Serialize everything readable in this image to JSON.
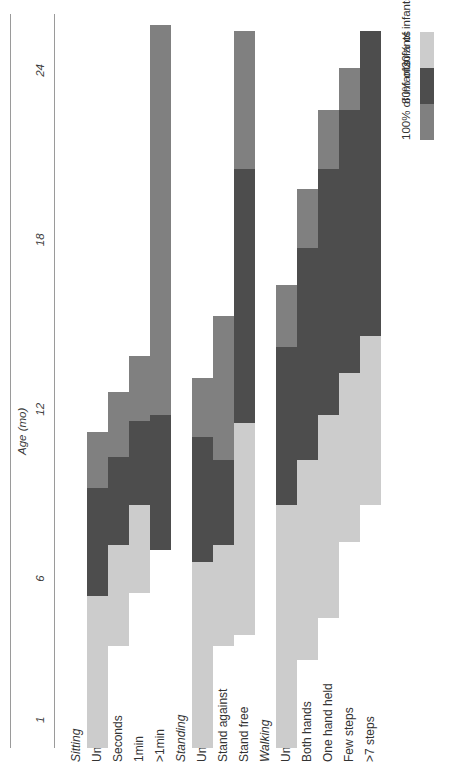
{
  "chart_data": {
    "type": "bar",
    "title": "",
    "xlabel": "Age (mo)",
    "ylabel": "",
    "xlim": [
      0,
      26
    ],
    "xticks": [
      1,
      6,
      12,
      18,
      24
    ],
    "xtick_labels": [
      "1",
      "6",
      "12",
      "18",
      "24"
    ],
    "grid": false,
    "legend_position": "bottom-right",
    "orientation": "horizontal",
    "note": "Horizontal range bars: each milestone row spans the age interval during which the stated proportion of infants show the skill.",
    "colors": {
      "pct100": "#808080",
      "pct80": "#4d4d4d",
      "pct20": "#cccccc",
      "axis": "#9a9a9a",
      "text": "#333333"
    },
    "groups": [
      {
        "name": "Sitting",
        "rows": [
          {
            "label": "Unable",
            "segments": [
              {
                "level": "20% of infants",
                "color": "#cccccc",
                "start": 0.0,
                "end": 5.4
              },
              {
                "level": "80% of infants",
                "color": "#4d4d4d",
                "start": 5.4,
                "end": 9.2
              },
              {
                "level": "100% of infants",
                "color": "#808080",
                "start": 9.2,
                "end": 11.2
              }
            ]
          },
          {
            "label": "Seconds",
            "segments": [
              {
                "level": "20% of infants",
                "color": "#cccccc",
                "start": 3.6,
                "end": 7.2
              },
              {
                "level": "80% of infants",
                "color": "#4d4d4d",
                "start": 7.2,
                "end": 10.3
              },
              {
                "level": "100% of infants",
                "color": "#808080",
                "start": 10.3,
                "end": 12.6
              }
            ]
          },
          {
            "label": "1min",
            "segments": [
              {
                "level": "20% of infants",
                "color": "#cccccc",
                "start": 5.5,
                "end": 8.6
              },
              {
                "level": "80% of infants",
                "color": "#4d4d4d",
                "start": 8.6,
                "end": 11.6
              },
              {
                "level": "100% of infants",
                "color": "#808080",
                "start": 11.6,
                "end": 13.9
              }
            ]
          },
          {
            "label": ">1min",
            "segments": [
              {
                "level": "80% of infants",
                "color": "#4d4d4d",
                "start": 7.0,
                "end": 11.8
              },
              {
                "level": "100% of infants",
                "color": "#808080",
                "start": 11.8,
                "end": 25.6
              }
            ]
          }
        ]
      },
      {
        "name": "Standing",
        "rows": [
          {
            "label": "Unable",
            "segments": [
              {
                "level": "20% of infants",
                "color": "#cccccc",
                "start": 0.0,
                "end": 6.6
              },
              {
                "level": "80% of infants",
                "color": "#4d4d4d",
                "start": 6.6,
                "end": 11.0
              },
              {
                "level": "100% of infants",
                "color": "#808080",
                "start": 11.0,
                "end": 13.1
              }
            ]
          },
          {
            "label": "Stand against",
            "segments": [
              {
                "level": "20% of infants",
                "color": "#cccccc",
                "start": 3.6,
                "end": 7.2
              },
              {
                "level": "80% of infants",
                "color": "#4d4d4d",
                "start": 7.2,
                "end": 10.2
              },
              {
                "level": "100% of infants",
                "color": "#808080",
                "start": 10.2,
                "end": 15.3
              }
            ]
          },
          {
            "label": "Stand free",
            "segments": [
              {
                "level": "20% of infants",
                "color": "#cccccc",
                "start": 4.0,
                "end": 11.5
              },
              {
                "level": "80% of infants",
                "color": "#4d4d4d",
                "start": 11.5,
                "end": 20.5
              },
              {
                "level": "100% of infants",
                "color": "#808080",
                "start": 20.5,
                "end": 25.4
              }
            ]
          }
        ]
      },
      {
        "name": "Walking",
        "rows": [
          {
            "label": "Unable",
            "segments": [
              {
                "level": "20% of infants",
                "color": "#cccccc",
                "start": 0.0,
                "end": 8.6
              },
              {
                "level": "80% of infants",
                "color": "#4d4d4d",
                "start": 8.6,
                "end": 14.2
              },
              {
                "level": "100% of infants",
                "color": "#808080",
                "start": 14.2,
                "end": 16.4
              }
            ]
          },
          {
            "label": "Both hands",
            "segments": [
              {
                "level": "20% of infants",
                "color": "#cccccc",
                "start": 3.1,
                "end": 10.2
              },
              {
                "level": "80% of infants",
                "color": "#4d4d4d",
                "start": 10.2,
                "end": 17.7
              },
              {
                "level": "100% of infants",
                "color": "#808080",
                "start": 17.7,
                "end": 19.8
              }
            ]
          },
          {
            "label": "One hand held",
            "segments": [
              {
                "level": "20% of infants",
                "color": "#cccccc",
                "start": 4.6,
                "end": 11.8
              },
              {
                "level": "80% of infants",
                "color": "#4d4d4d",
                "start": 11.8,
                "end": 20.5
              },
              {
                "level": "100% of infants",
                "color": "#808080",
                "start": 20.5,
                "end": 22.6
              }
            ]
          },
          {
            "label": "Few steps",
            "segments": [
              {
                "level": "20% of infants",
                "color": "#cccccc",
                "start": 7.3,
                "end": 13.3
              },
              {
                "level": "80% of infants",
                "color": "#4d4d4d",
                "start": 13.3,
                "end": 22.6
              },
              {
                "level": "100% of infants",
                "color": "#808080",
                "start": 22.6,
                "end": 24.1
              }
            ]
          },
          {
            "label": ">7 steps",
            "segments": [
              {
                "level": "20% of infants",
                "color": "#cccccc",
                "start": 8.6,
                "end": 14.6
              },
              {
                "level": "80% of infants",
                "color": "#4d4d4d",
                "start": 14.6,
                "end": 25.4
              }
            ]
          }
        ]
      }
    ],
    "legend": {
      "title": "Key",
      "entries": [
        {
          "label": "100% of infants",
          "color": "#808080"
        },
        {
          "label": "80% of infants",
          "color": "#4d4d4d"
        },
        {
          "label": "20% of infants",
          "color": "#cccccc"
        }
      ]
    }
  }
}
